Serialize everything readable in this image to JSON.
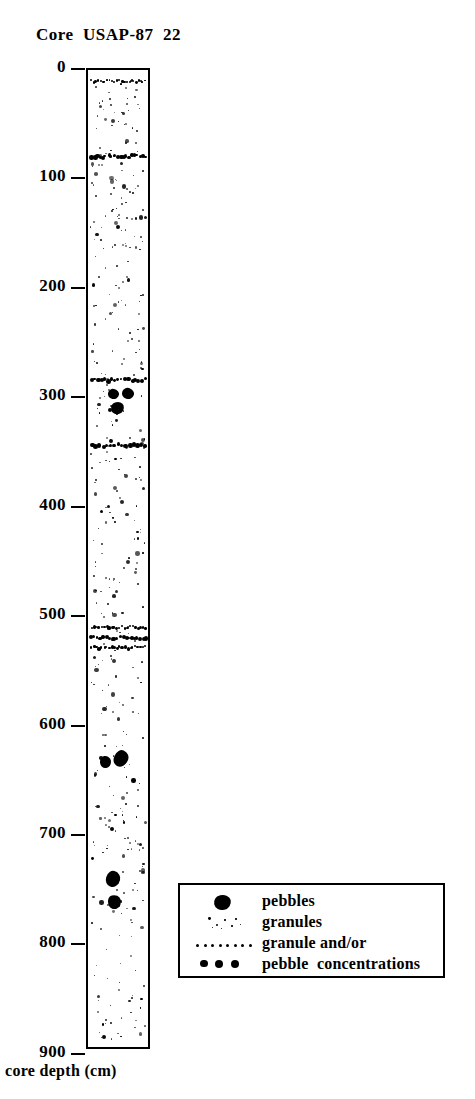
{
  "title": "Core  USAP-87  22",
  "axis": {
    "label": "core depth (cm)",
    "unit": "cm",
    "ticks": [
      {
        "value": "0",
        "depth_cm": 0
      },
      {
        "value": "100",
        "depth_cm": 100
      },
      {
        "value": "200",
        "depth_cm": 200
      },
      {
        "value": "300",
        "depth_cm": 300
      },
      {
        "value": "400",
        "depth_cm": 400
      },
      {
        "value": "500",
        "depth_cm": 500
      },
      {
        "value": "600",
        "depth_cm": 600
      },
      {
        "value": "700",
        "depth_cm": 700
      },
      {
        "value": "800",
        "depth_cm": 800
      },
      {
        "value": "900",
        "depth_cm": 900
      }
    ]
  },
  "legend": {
    "items": [
      {
        "symbol": "pebble-glyph",
        "label": "pebbles"
      },
      {
        "symbol": "granule-scatter-glyph",
        "label": "granules"
      },
      {
        "symbol": "dotted-line-glyph",
        "label": "granule and/or"
      },
      {
        "symbol": "large-dots-glyph",
        "label": "pebble  concentrations"
      }
    ]
  },
  "chart_data": {
    "type": "column-log",
    "title": "Core  USAP-87  22",
    "ylabel": "core depth (cm)",
    "ylim": [
      0,
      912
    ],
    "grid": false,
    "legend_position": "bottom-right",
    "column_top_cm": 0,
    "column_bottom_cm": 912,
    "concentration_bands_cm": [
      10,
      78,
      282,
      342,
      520,
      527,
      509
    ],
    "pebbles_cm": [
      {
        "depth_cm": 296,
        "x_frac": 0.33,
        "w": 11,
        "h": 10
      },
      {
        "depth_cm": 296,
        "x_frac": 0.56,
        "w": 12,
        "h": 11
      },
      {
        "depth_cm": 309,
        "x_frac": 0.38,
        "w": 13,
        "h": 12
      },
      {
        "depth_cm": 632,
        "x_frac": 0.2,
        "w": 11,
        "h": 12
      },
      {
        "depth_cm": 629,
        "x_frac": 0.44,
        "w": 14,
        "h": 17
      },
      {
        "depth_cm": 739,
        "x_frac": 0.3,
        "w": 14,
        "h": 16
      },
      {
        "depth_cm": 760,
        "x_frac": 0.34,
        "w": 13,
        "h": 14
      }
    ],
    "granule_density": "moderate, distributed through full core"
  }
}
